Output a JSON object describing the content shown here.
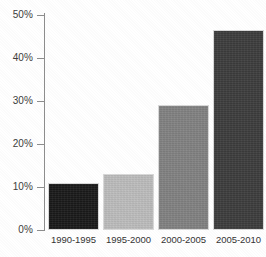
{
  "chart_data": {
    "type": "bar",
    "title": "",
    "subtitle": "",
    "xlabel": "",
    "ylabel": "",
    "categories": [
      "1990-1995",
      "1995-2000",
      "2000-2005",
      "2005-2010"
    ],
    "values": [
      11,
      13,
      29,
      46.5
    ],
    "value_labels": [
      "11%",
      "13%",
      "29%",
      "46.5%"
    ],
    "ylim": [
      0,
      50
    ],
    "ytick_labels": [
      "0%",
      "10%",
      "20%",
      "30%",
      "40%",
      "50%"
    ],
    "ytick_values": [
      0,
      10,
      20,
      30,
      40,
      50
    ],
    "grid": false,
    "legend": "none",
    "bar_colors": [
      "#1a1a1a",
      "#bdbdbd",
      "#828282",
      "#3d3d3d"
    ],
    "bar_border_color": "#d9d9d9",
    "axis_color": "#8e8e8e",
    "background": "#ffffff",
    "text_color": "#3d3d3d"
  }
}
